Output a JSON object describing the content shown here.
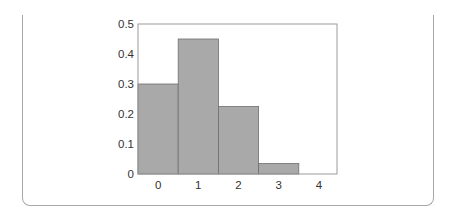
{
  "chart_data": {
    "type": "bar",
    "title": "",
    "xlabel": "",
    "ylabel": "",
    "categories": [
      "0",
      "1",
      "2",
      "3",
      "4"
    ],
    "values": [
      0.3,
      0.45,
      0.225,
      0.035,
      0.0
    ],
    "ylim": [
      0,
      0.5
    ],
    "yticks": [
      "0",
      "0.1",
      "0.2",
      "0.3",
      "0.4",
      "0.5"
    ],
    "grid": false,
    "legend": null,
    "bar_color": "#a9a9a9",
    "bar_edge_color": "#6e6e6e"
  }
}
